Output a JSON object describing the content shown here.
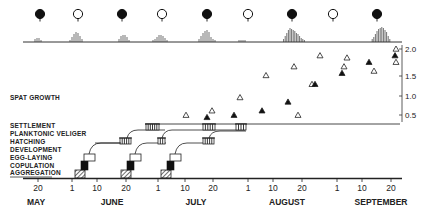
{
  "labels": {
    "spat_growth": "SPAT GROWTH",
    "settlement": "SETTLEMENT",
    "planktonic_veliger": "PLANKTONIC VELIGER",
    "hatching": "HATCHING",
    "development": "DEVELOPMENT",
    "egg_laying": "EGG-LAYING",
    "copulation": "COPULATION",
    "aggregation": "AGGREGATION"
  },
  "x_axis": {
    "ticks": [
      {
        "label": "20",
        "x": 38
      },
      {
        "label": "1",
        "x": 72
      },
      {
        "label": "10",
        "x": 97
      },
      {
        "label": "20",
        "x": 126
      },
      {
        "label": "1",
        "x": 158
      },
      {
        "label": "10",
        "x": 185
      },
      {
        "label": "20",
        "x": 213
      },
      {
        "label": "1",
        "x": 248
      },
      {
        "label": "10",
        "x": 273
      },
      {
        "label": "20",
        "x": 302
      },
      {
        "label": "1",
        "x": 337
      },
      {
        "label": "10",
        "x": 362
      },
      {
        "label": "20",
        "x": 391
      }
    ],
    "months": [
      {
        "label": "MAY",
        "x": 36
      },
      {
        "label": "JUNE",
        "x": 112
      },
      {
        "label": "JULY",
        "x": 196
      },
      {
        "label": "AUGUST",
        "x": 287
      },
      {
        "label": "SEPTEMBER",
        "x": 381
      }
    ]
  },
  "y_axis": {
    "ticks": [
      {
        "label": "2.0",
        "y": 49
      },
      {
        "label": "1.5",
        "y": 76
      },
      {
        "label": "1.0",
        "y": 96
      },
      {
        "label": "0.5",
        "y": 115
      }
    ]
  },
  "moon_phases": [
    {
      "phase": "new",
      "x": 40
    },
    {
      "phase": "full",
      "x": 78
    },
    {
      "phase": "new",
      "x": 122
    },
    {
      "phase": "full",
      "x": 162
    },
    {
      "phase": "new",
      "x": 207
    },
    {
      "phase": "full",
      "x": 248
    },
    {
      "phase": "new",
      "x": 292
    },
    {
      "phase": "full",
      "x": 333
    },
    {
      "phase": "new",
      "x": 377
    }
  ],
  "chart_data": {
    "type": "scatter",
    "title": "",
    "xlabel": "Date (May - September)",
    "ylabel": "Spat growth",
    "ylim": [
      0.3,
      2.1
    ],
    "series": [
      {
        "name": "spat growth (open)",
        "marker": "open-triangle",
        "points": [
          [
            186,
            0.5
          ],
          [
            212,
            0.6
          ],
          [
            240,
            0.9
          ],
          [
            266,
            1.4
          ],
          [
            298,
            0.5
          ],
          [
            312,
            1.2
          ],
          [
            294,
            1.6
          ],
          [
            320,
            1.85
          ],
          [
            344,
            1.6
          ],
          [
            347,
            1.8
          ],
          [
            374,
            1.5
          ],
          [
            396,
            2.0
          ],
          [
            396,
            1.7
          ]
        ]
      },
      {
        "name": "spat growth (filled)",
        "marker": "filled-triangle",
        "points": [
          [
            207,
            0.45
          ],
          [
            234,
            0.5
          ],
          [
            262,
            0.6
          ],
          [
            288,
            0.8
          ],
          [
            315,
            1.2
          ],
          [
            342,
            1.45
          ],
          [
            369,
            1.7
          ],
          [
            395,
            1.85
          ]
        ]
      }
    ],
    "annotations": [
      "SPAT GROWTH",
      "SETTLEMENT",
      "PLANKTONIC VELIGER",
      "HATCHING",
      "DEVELOPMENT",
      "EGG-LAYING",
      "COPULATION",
      "AGGREGATION"
    ]
  }
}
